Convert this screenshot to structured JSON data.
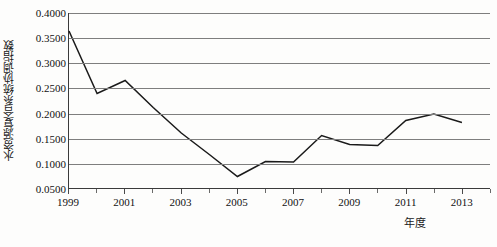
{
  "chart_data": {
    "type": "line",
    "title": "",
    "xlabel": "年度",
    "ylabel": "水资源复合系统协调指数",
    "x": [
      1999,
      2000,
      2001,
      2002,
      2003,
      2004,
      2005,
      2006,
      2007,
      2008,
      2009,
      2010,
      2011,
      2012,
      2013
    ],
    "values": [
      0.364,
      0.239,
      0.265,
      0.211,
      0.16,
      0.117,
      0.073,
      0.103,
      0.102,
      0.155,
      0.137,
      0.135,
      0.185,
      0.198,
      0.181
    ],
    "series": [
      {
        "name": "水资源复合系统协调指数",
        "values": [
          0.364,
          0.239,
          0.265,
          0.211,
          0.16,
          0.117,
          0.073,
          0.103,
          0.102,
          0.155,
          0.137,
          0.135,
          0.185,
          0.198,
          0.181
        ]
      }
    ],
    "ylim": [
      0.05,
      0.4
    ],
    "xlim": [
      1999,
      2014
    ],
    "y_ticks": [
      0.05,
      0.1,
      0.15,
      0.2,
      0.25,
      0.3,
      0.35,
      0.4
    ],
    "y_tick_labels": [
      "0.0500",
      "0.1000",
      "0.1500",
      "0.2000",
      "0.2500",
      "0.3000",
      "0.3500",
      "0.4000"
    ],
    "x_ticks": [
      1999,
      2001,
      2003,
      2005,
      2007,
      2009,
      2011,
      2013
    ],
    "x_tick_labels": [
      "1999",
      "2001",
      "2003",
      "2005",
      "2007",
      "2009",
      "2011",
      "2013"
    ],
    "x_minor_ticks": [
      2000,
      2002,
      2004,
      2006,
      2008,
      2010,
      2012,
      2014
    ],
    "grid": true,
    "grid_axis": "y",
    "legend": false,
    "legend_position": "none",
    "line_color": "#1a1a1a",
    "grid_color": "#7e7e7e",
    "axis_color": "#3b3b3b",
    "background_color": "#fdfdfc"
  }
}
